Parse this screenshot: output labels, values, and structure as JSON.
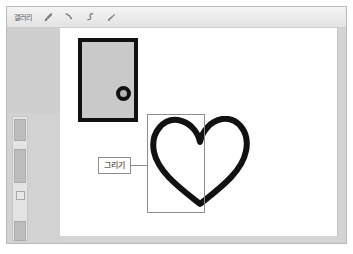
{
  "window": {
    "title": "갤러리"
  },
  "toolbar": {
    "title": "갤러리",
    "tools": [
      {
        "name": "brush-icon",
        "label": "브러시"
      },
      {
        "name": "pen-icon",
        "label": "폜"
      },
      {
        "name": "curve-icon",
        "label": "곡선"
      },
      {
        "name": "eraser-icon",
        "label": "지우개"
      }
    ]
  },
  "sidebar": {
    "scrollbar": {
      "name": "vertical-scrollbar"
    }
  },
  "canvas": {
    "shapes": {
      "door": {
        "name": "door-shape",
        "fill": "#c9c9c9",
        "stroke": "#111111",
        "knob_fill": "#b5b5b5"
      },
      "heart": {
        "name": "heart-shape",
        "stroke": "#111111",
        "fill": "none"
      }
    },
    "selection": {
      "name": "selection-rectangle",
      "stroke": "#8d8d8d"
    },
    "callout": {
      "label": "그리기",
      "border": "#8d8d8d"
    }
  },
  "colors": {
    "frame": "#d9d9d9",
    "toolbar": "#ebebeb",
    "sidebar": "#d2d2d2",
    "canvas": "#ffffff",
    "ink": "#111111"
  }
}
